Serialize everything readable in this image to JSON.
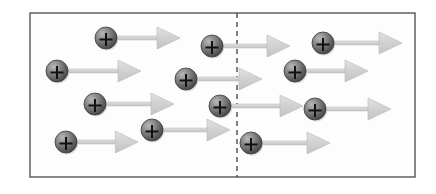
{
  "figure": {
    "canvas": {
      "width": 436,
      "height": 194
    },
    "background_color": "#ffffff",
    "frame": {
      "name": "container-rectangle",
      "x": 30,
      "y": 13,
      "width": 385,
      "height": 164,
      "stroke_color": "#555555",
      "stroke_width": 1.4,
      "fill_color": "#fdfdfd"
    },
    "divider": {
      "name": "dashed-boundary-line",
      "x": 237,
      "y_top": 13,
      "y_bottom": 177,
      "stroke_color": "#4a4a4a",
      "stroke_width": 1.4,
      "dash_pattern": "5,4",
      "orientation": "vertical"
    },
    "charge_symbol": "+",
    "particle_style": {
      "radius": 11,
      "fill_dark": "#4a4a4a",
      "fill_mid": "#7a7a7a",
      "fill_light": "#b5b5b5",
      "outline_color": "#3c3c3c",
      "sign_color": "#111111"
    },
    "arrow_style": {
      "shaft_color": "#d4d4d4",
      "head_color": "#d0d0d0",
      "edge_color": "#bdbdbd",
      "shaft_thickness": 4,
      "head_length": 26,
      "head_half_width": 11,
      "direction": "right"
    },
    "particles": [
      {
        "id": "p1",
        "label": "+",
        "cx": 106,
        "cy": 38,
        "arrow_start": 117,
        "arrow_end": 180,
        "side": "left"
      },
      {
        "id": "p2",
        "label": "+",
        "cx": 212,
        "cy": 46,
        "arrow_start": 223,
        "arrow_end": 290,
        "side": "left"
      },
      {
        "id": "p3",
        "label": "+",
        "cx": 323,
        "cy": 43,
        "arrow_start": 334,
        "arrow_end": 402,
        "side": "right"
      },
      {
        "id": "p4",
        "label": "+",
        "cx": 57,
        "cy": 71,
        "arrow_start": 68,
        "arrow_end": 141,
        "side": "left"
      },
      {
        "id": "p5",
        "label": "+",
        "cx": 186,
        "cy": 79,
        "arrow_start": 197,
        "arrow_end": 262,
        "side": "left"
      },
      {
        "id": "p6",
        "label": "+",
        "cx": 295,
        "cy": 71,
        "arrow_start": 306,
        "arrow_end": 368,
        "side": "right"
      },
      {
        "id": "p7",
        "label": "+",
        "cx": 95,
        "cy": 104,
        "arrow_start": 106,
        "arrow_end": 174,
        "side": "left"
      },
      {
        "id": "p8",
        "label": "+",
        "cx": 220,
        "cy": 106,
        "arrow_start": 231,
        "arrow_end": 303,
        "side": "left"
      },
      {
        "id": "p9",
        "label": "+",
        "cx": 315,
        "cy": 109,
        "arrow_start": 326,
        "arrow_end": 391,
        "side": "right"
      },
      {
        "id": "p10",
        "label": "+",
        "cx": 152,
        "cy": 130,
        "arrow_start": 163,
        "arrow_end": 230,
        "side": "left"
      },
      {
        "id": "p11",
        "label": "+",
        "cx": 66,
        "cy": 142,
        "arrow_start": 77,
        "arrow_end": 138,
        "side": "left"
      },
      {
        "id": "p12",
        "label": "+",
        "cx": 251,
        "cy": 143,
        "arrow_start": 262,
        "arrow_end": 330,
        "side": "right"
      }
    ],
    "counts": {
      "total_particles": 12,
      "left_of_boundary": 7,
      "right_of_boundary": 5
    }
  }
}
